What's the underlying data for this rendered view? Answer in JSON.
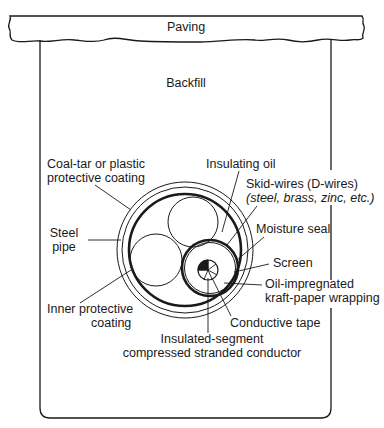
{
  "diagram": {
    "colors": {
      "stroke": "#1a1a1a",
      "background": "#ffffff"
    },
    "layers": {
      "paving": "Paving",
      "backfill": "Backfill"
    },
    "labels": {
      "coal_tar_line1": "Coal-tar or plastic",
      "coal_tar_line2": "protective coating",
      "steel_pipe_line1": "Steel",
      "steel_pipe_line2": "pipe",
      "inner_coating_line1": "Inner protective",
      "inner_coating_line2": "coating",
      "insulating_oil": "Insulating oil",
      "skid_wires_line1": "Skid-wires (D-wires)",
      "skid_wires_line2": "(steel, brass, zinc, etc.)",
      "moisture_seal": "Moisture seal",
      "screen": "Screen",
      "oil_paper_line1": "Oil-impregnated",
      "oil_paper_line2": "kraft-paper wrapping",
      "conductive_tape": "Conductive tape",
      "conductor_line1": "Insulated-segment",
      "conductor_line2": "compressed stranded conductor"
    }
  }
}
